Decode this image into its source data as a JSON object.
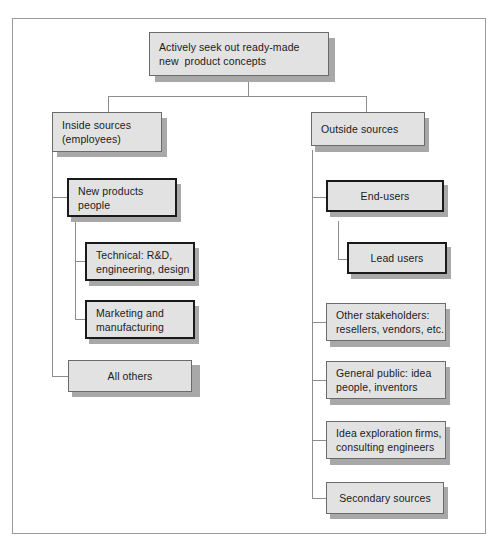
{
  "diagram": {
    "frame_color": "#9a9a9a",
    "box_fill": "#e2e2e2",
    "shadow_color": "#a8a8a8",
    "line_color": "#8d8d8d",
    "nodes": {
      "root": {
        "id": "root",
        "line1": "Actively seek out ready-made",
        "line2": "new  product concepts",
        "align": "left",
        "border": "thin"
      },
      "inside": {
        "id": "inside-sources",
        "line1": "Inside sources",
        "line2": "(employees)",
        "align": "left",
        "border": "thin"
      },
      "outside": {
        "id": "outside-sources",
        "line1": "Outside sources",
        "line2": "",
        "align": "left",
        "border": "thin"
      },
      "inside_children": [
        {
          "id": "new-products-people",
          "line1": "New products",
          "line2": "people",
          "align": "left",
          "border": "thick"
        },
        {
          "id": "technical-rd",
          "line1": "Technical: R&D,",
          "line2": "engineering, design",
          "align": "left",
          "border": "thick"
        },
        {
          "id": "marketing-manufacturing",
          "line1": "Marketing and",
          "line2": "manufacturing",
          "align": "left",
          "border": "thick"
        },
        {
          "id": "all-others",
          "line1": "All others",
          "line2": "",
          "align": "center",
          "border": "thin"
        }
      ],
      "outside_children": [
        {
          "id": "end-users",
          "line1": "End-users",
          "line2": "",
          "align": "center",
          "border": "thick"
        },
        {
          "id": "lead-users",
          "line1": "Lead users",
          "line2": "",
          "align": "center",
          "border": "thick"
        },
        {
          "id": "other-stakeholders",
          "line1": "Other stakeholders:",
          "line2": "resellers, vendors, etc.",
          "align": "left",
          "border": "thin"
        },
        {
          "id": "general-public",
          "line1": "General public: idea",
          "line2": "people, inventors",
          "align": "left",
          "border": "thin"
        },
        {
          "id": "idea-exploration-firms",
          "line1": "Idea exploration firms,",
          "line2": "consulting engineers",
          "align": "left",
          "border": "thin"
        },
        {
          "id": "secondary-sources",
          "line1": "Secondary sources",
          "line2": "",
          "align": "center",
          "border": "thin"
        }
      ]
    }
  }
}
